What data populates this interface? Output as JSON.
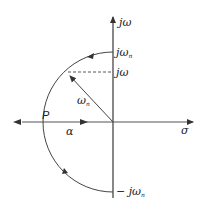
{
  "diagram": {
    "axes": {
      "vertical_label": "jω",
      "horizontal_label": "σ"
    },
    "labels": {
      "top_intercept": "jω",
      "top_intercept_sub": "n",
      "pole_height": "jω",
      "radius": "ω",
      "radius_sub": "n",
      "bottom_intercept": "− jω",
      "bottom_intercept_sub": "n",
      "point": "P",
      "real_part": "α"
    },
    "colors": {
      "stroke": "#333333",
      "axis": "#555555",
      "text": "#222222"
    }
  }
}
